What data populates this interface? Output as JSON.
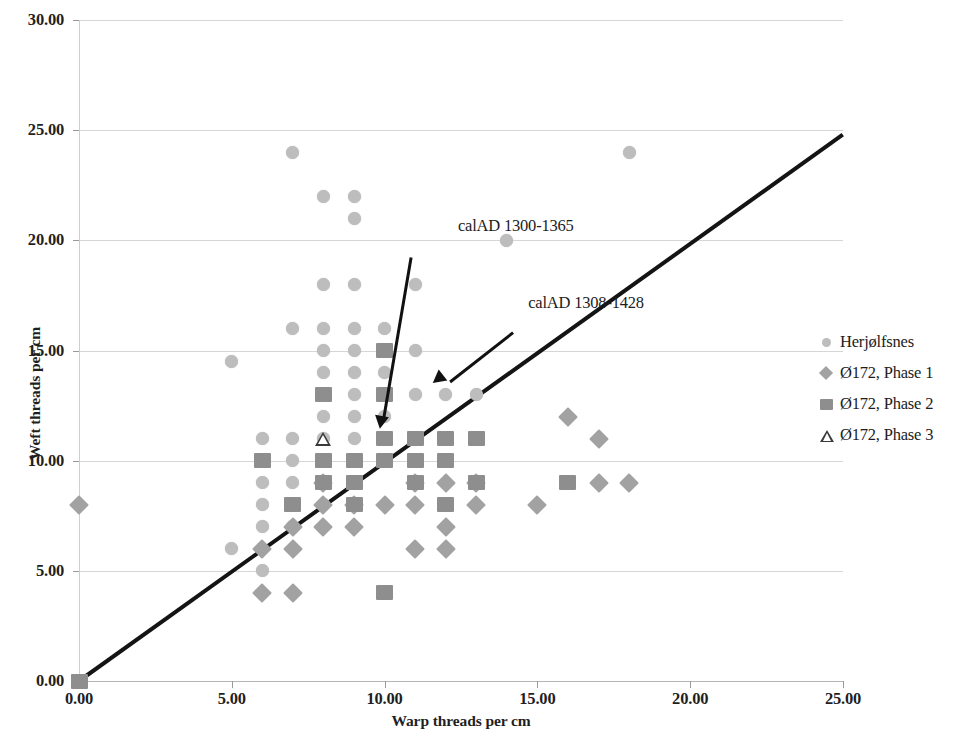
{
  "chart_data": {
    "type": "scatter",
    "title": "",
    "xlabel": "Warp threads per cm",
    "ylabel": "Weft threads per cm",
    "xlim": [
      0,
      25
    ],
    "ylim": [
      0,
      30
    ],
    "xticks": [
      "0.00",
      "5.00",
      "10.00",
      "15.00",
      "20.00",
      "25.00"
    ],
    "yticks": [
      "0.00",
      "5.00",
      "10.00",
      "15.00",
      "20.00",
      "25.00",
      "30.00"
    ],
    "xtick_values": [
      0,
      5,
      10,
      15,
      20,
      25
    ],
    "ytick_values": [
      0,
      5,
      10,
      15,
      20,
      25,
      30
    ],
    "grid": "horizontal",
    "legend_position": "right",
    "series": [
      {
        "name": "Herjølfsnes",
        "marker": "circle",
        "color": "#bdbdbd",
        "points": [
          [
            5,
            14.5
          ],
          [
            5,
            6
          ],
          [
            6,
            11
          ],
          [
            6,
            9
          ],
          [
            6,
            8
          ],
          [
            6,
            7
          ],
          [
            6,
            5
          ],
          [
            7,
            24
          ],
          [
            7,
            16
          ],
          [
            7,
            11
          ],
          [
            7,
            10
          ],
          [
            7,
            9
          ],
          [
            7,
            8
          ],
          [
            7,
            7
          ],
          [
            8,
            22
          ],
          [
            8,
            18
          ],
          [
            8,
            16
          ],
          [
            8,
            15
          ],
          [
            8,
            14
          ],
          [
            8,
            13
          ],
          [
            8,
            12
          ],
          [
            8,
            11
          ],
          [
            8,
            10
          ],
          [
            8,
            9
          ],
          [
            8,
            8
          ],
          [
            9,
            22
          ],
          [
            9,
            21
          ],
          [
            9,
            18
          ],
          [
            9,
            16
          ],
          [
            9,
            15
          ],
          [
            9,
            14
          ],
          [
            9,
            13
          ],
          [
            9,
            12
          ],
          [
            9,
            11
          ],
          [
            9,
            10
          ],
          [
            9,
            9
          ],
          [
            10,
            16
          ],
          [
            10,
            15
          ],
          [
            10,
            14
          ],
          [
            10,
            13
          ],
          [
            10,
            12
          ],
          [
            10,
            11
          ],
          [
            10,
            10
          ],
          [
            11,
            18
          ],
          [
            11,
            15
          ],
          [
            11,
            13
          ],
          [
            11,
            11
          ],
          [
            12,
            13
          ],
          [
            13,
            13
          ],
          [
            14,
            20
          ],
          [
            18,
            24
          ]
        ]
      },
      {
        "name": "Ø172, Phase 1",
        "marker": "diamond",
        "color": "#a2a2a2",
        "points": [
          [
            0,
            8
          ],
          [
            6,
            6
          ],
          [
            6,
            4
          ],
          [
            7,
            7
          ],
          [
            7,
            6
          ],
          [
            7,
            4
          ],
          [
            8,
            9
          ],
          [
            8,
            8
          ],
          [
            8,
            7
          ],
          [
            9,
            8
          ],
          [
            9,
            7
          ],
          [
            10,
            8
          ],
          [
            11,
            9
          ],
          [
            11,
            8
          ],
          [
            11,
            6
          ],
          [
            12,
            9
          ],
          [
            12,
            7
          ],
          [
            12,
            6
          ],
          [
            13,
            9
          ],
          [
            13,
            8
          ],
          [
            15,
            8
          ],
          [
            16,
            12
          ],
          [
            17,
            11
          ],
          [
            17,
            9
          ],
          [
            18,
            9
          ]
        ]
      },
      {
        "name": "Ø172, Phase 2",
        "marker": "square",
        "color": "#8e8e8e",
        "points": [
          [
            0,
            0
          ],
          [
            6,
            10
          ],
          [
            7,
            8
          ],
          [
            8,
            13
          ],
          [
            8,
            10
          ],
          [
            8,
            9
          ],
          [
            9,
            10
          ],
          [
            9,
            9
          ],
          [
            9,
            8
          ],
          [
            10,
            15
          ],
          [
            10,
            13
          ],
          [
            10,
            11
          ],
          [
            10,
            10
          ],
          [
            10,
            4
          ],
          [
            11,
            11
          ],
          [
            11,
            10
          ],
          [
            11,
            9
          ],
          [
            12,
            11
          ],
          [
            12,
            10
          ],
          [
            12,
            8
          ],
          [
            13,
            11
          ],
          [
            13,
            9
          ],
          [
            16,
            9
          ]
        ]
      },
      {
        "name": "Ø172, Phase 3",
        "marker": "triangle",
        "color": "#3a3a3a",
        "points": [
          [
            8,
            11
          ]
        ]
      }
    ],
    "trendline": {
      "x0": 0,
      "y0": 0,
      "x1": 25,
      "y1": 24.8,
      "color": "#141414",
      "width": 4
    },
    "annotations": [
      {
        "text": "calAD 1300-1365",
        "text_x": 12.4,
        "text_y": 20.6,
        "arrow_from_x": 10.85,
        "arrow_from_y": 19.2,
        "arrow_to_x": 9.9,
        "arrow_to_y": 11.45
      },
      {
        "text": "calAD 1308-1428",
        "text_x": 14.7,
        "text_y": 17.1,
        "arrow_from_x": 14.2,
        "arrow_from_y": 15.8,
        "arrow_to_x": 11.9,
        "arrow_to_y": 13.3
      }
    ]
  },
  "legend": {
    "items": [
      {
        "label": "Herjølfsnes",
        "marker": "circle"
      },
      {
        "label": "Ø172, Phase 1",
        "marker": "diamond"
      },
      {
        "label": "Ø172, Phase 2",
        "marker": "square"
      },
      {
        "label": "Ø172, Phase 3",
        "marker": "triangle"
      }
    ]
  }
}
